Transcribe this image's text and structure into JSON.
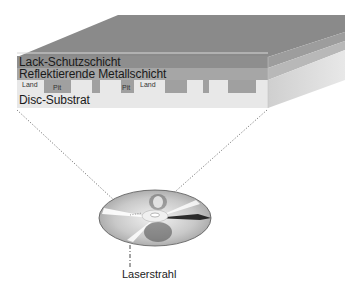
{
  "diagram": {
    "type": "cross-section",
    "layers": [
      {
        "id": "lacquer",
        "label": "Lack-Schutzschicht",
        "color": "#8c8c8c"
      },
      {
        "id": "metal",
        "label": "Reflektierende Metallschicht",
        "color": "#a8a8a8"
      },
      {
        "id": "substrate",
        "label": "Disc-Substrat",
        "color": "#e6e6e6"
      }
    ],
    "surface_labels": {
      "land_1": "Land",
      "pit_1": "Pit",
      "pit_2": "Pit",
      "land_2": "Land"
    },
    "laser_label": "Laserstrahl",
    "colors": {
      "top_face": "#8a8a8a",
      "front_metal": "#a5a5a5",
      "side_dark": "#b5b5b5",
      "side_light": "#e3e3e3",
      "pit": "#9e9e9e",
      "land": "#ececec",
      "dotted": "#555555"
    }
  }
}
